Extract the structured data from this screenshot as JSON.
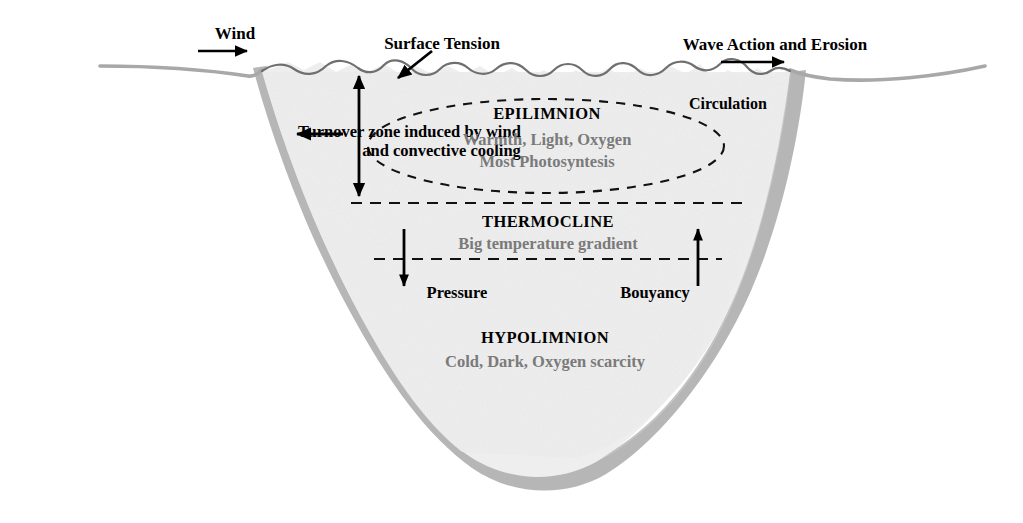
{
  "diagram": {
    "colors": {
      "bank_gray": "#b2b2b2",
      "water_fill": "#eeeeee",
      "shore_line": "#9a9a9a",
      "surface_line": "#6f6f6f",
      "heading_text": "#000000",
      "description_text": "#7a7a7a",
      "arrow_black": "#000000",
      "background": "#ffffff"
    },
    "annotations": {
      "wind": "Wind",
      "surface_tension": "Surface Tension",
      "wave_action": "Wave Action and Erosion",
      "circulation": "Circulation",
      "turnover_line1": "Turnover zone induced by wind",
      "turnover_line2": "and convective cooling",
      "pressure": "Pressure",
      "buoyancy": "Bouyancy"
    },
    "layers": [
      {
        "id": "epilimnion",
        "title": "EPILIMNION",
        "line1": "Warmth, Light, Oxygen",
        "line2": "Most Photosyntesis"
      },
      {
        "id": "thermocline",
        "title": "THERMOCLINE",
        "line1": "Big temperature gradient"
      },
      {
        "id": "hypolimnion",
        "title": "HYPOLIMNION",
        "line1": "Cold, Dark, Oxygen scarcity"
      }
    ]
  }
}
